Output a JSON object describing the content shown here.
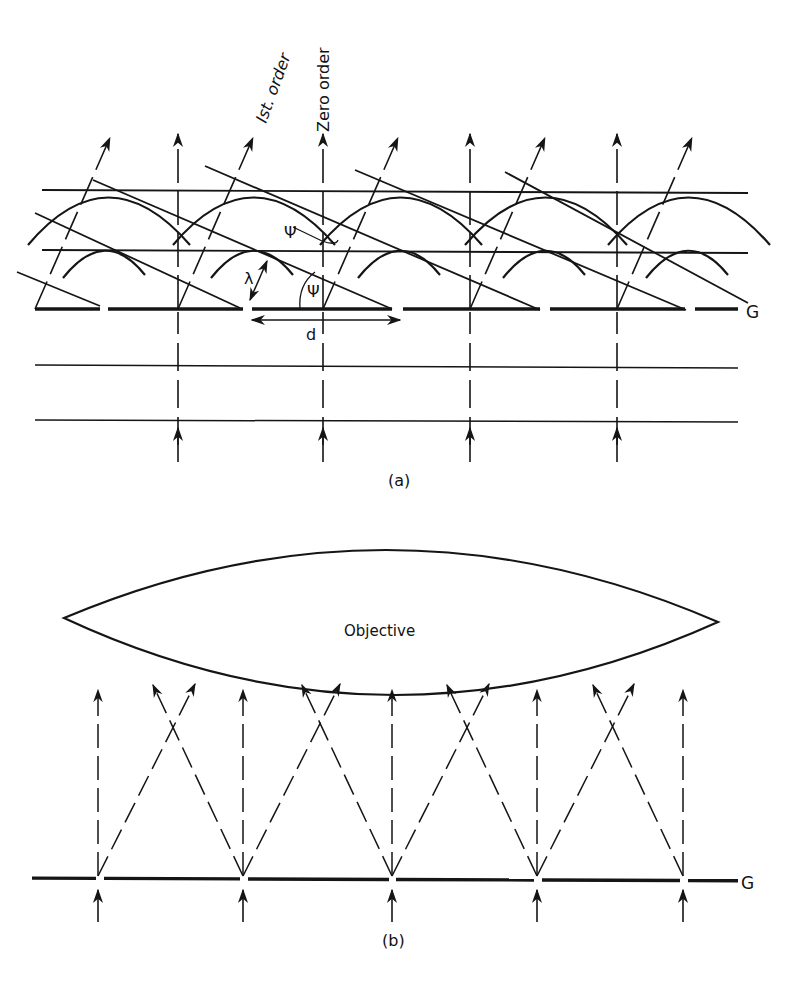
{
  "figure": {
    "panel_a": {
      "caption": "(a)",
      "label_zero_order": "Zero order",
      "label_first_order": "Ist. order",
      "label_grating": "G",
      "label_psi_upper": "Ψ",
      "label_psi_lower": "Ψ",
      "label_lambda": "λ",
      "label_d": "d",
      "grating_y": 309,
      "grating_segments": [
        [
          35,
          100
        ],
        [
          108,
          243
        ],
        [
          252,
          392
        ],
        [
          403,
          540
        ],
        [
          550,
          685
        ],
        [
          695,
          738
        ]
      ],
      "slot_x": [
        178,
        323,
        470,
        617
      ],
      "incident_wavefront_y": [
        367,
        421
      ],
      "wavefront_horizontal_y": [
        190,
        250
      ],
      "first_order_x_top_offset": 85
    },
    "panel_b": {
      "caption": "(b)",
      "lens_label": "Objective",
      "label_grating": "G",
      "grating_y": 880,
      "slot_x": [
        98,
        243,
        392,
        537,
        683
      ],
      "arrow_top_y": 690
    }
  }
}
